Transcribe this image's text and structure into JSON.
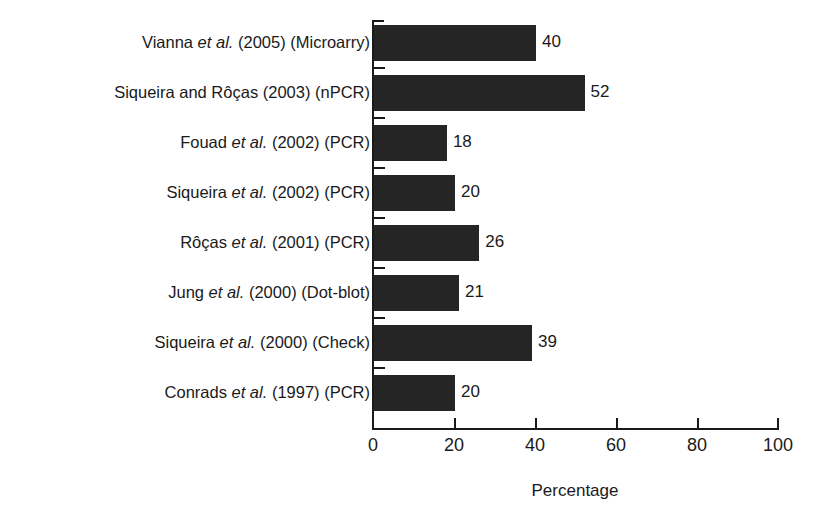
{
  "chart_data": {
    "type": "bar",
    "orientation": "horizontal",
    "title": "",
    "xlabel": "Percentage",
    "ylabel": "",
    "xlim": [
      0,
      100
    ],
    "xticks": [
      0,
      20,
      40,
      60,
      80,
      100
    ],
    "xtick_labels": [
      "0",
      "20",
      "40",
      "60",
      "80",
      "100"
    ],
    "grid": false,
    "legend": null,
    "bar_color": "#252525",
    "axis_color": "#1a1a1a",
    "background_color": "#ffffff",
    "categories": [
      "Vianna et al. (2005) (Microarry)",
      "Siqueira and Rôças (2003) (nPCR)",
      "Fouad et al. (2002) (PCR)",
      "Siqueira et al. (2002) (PCR)",
      "Rôças et al. (2001) (PCR)",
      "Jung et al. (2000) (Dot-blot)",
      "Siqueira et al. (2000) (Check)",
      "Conrads et al. (1997) (PCR)"
    ],
    "values": [
      40,
      52,
      18,
      20,
      26,
      21,
      39,
      20
    ],
    "data_labels": [
      "40",
      "52",
      "18",
      "20",
      "26",
      "21",
      "39",
      "20"
    ],
    "bars": [
      {
        "label_parts": [
          {
            "text": "Vianna ",
            "italic": false
          },
          {
            "text": "et al.",
            "italic": true
          },
          {
            "text": " (2005) (Microarry)",
            "italic": false
          }
        ],
        "value": 40,
        "value_label": "40"
      },
      {
        "label_parts": [
          {
            "text": "Siqueira and Rôças (2003) (nPCR)",
            "italic": false
          }
        ],
        "value": 52,
        "value_label": "52"
      },
      {
        "label_parts": [
          {
            "text": "Fouad ",
            "italic": false
          },
          {
            "text": "et al.",
            "italic": true
          },
          {
            "text": " (2002) (PCR)",
            "italic": false
          }
        ],
        "value": 18,
        "value_label": "18"
      },
      {
        "label_parts": [
          {
            "text": "Siqueira ",
            "italic": false
          },
          {
            "text": "et al.",
            "italic": true
          },
          {
            "text": " (2002) (PCR)",
            "italic": false
          }
        ],
        "value": 20,
        "value_label": "20"
      },
      {
        "label_parts": [
          {
            "text": "Rôças ",
            "italic": false
          },
          {
            "text": "et al.",
            "italic": true
          },
          {
            "text": " (2001) (PCR)",
            "italic": false
          }
        ],
        "value": 26,
        "value_label": "26"
      },
      {
        "label_parts": [
          {
            "text": "Jung ",
            "italic": false
          },
          {
            "text": "et al.",
            "italic": true
          },
          {
            "text": " (2000) (Dot-blot)",
            "italic": false
          }
        ],
        "value": 21,
        "value_label": "21"
      },
      {
        "label_parts": [
          {
            "text": "Siqueira ",
            "italic": false
          },
          {
            "text": "et al.",
            "italic": true
          },
          {
            "text": " (2000) (Check)",
            "italic": false
          }
        ],
        "value": 39,
        "value_label": "39"
      },
      {
        "label_parts": [
          {
            "text": "Conrads ",
            "italic": false
          },
          {
            "text": "et al.",
            "italic": true
          },
          {
            "text": " (1997) (PCR)",
            "italic": false
          }
        ],
        "value": 20,
        "value_label": "20"
      }
    ]
  }
}
